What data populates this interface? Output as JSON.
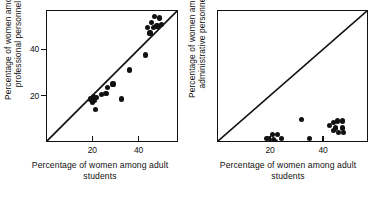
{
  "figure": {
    "panel_count": 2,
    "background_color": "#ffffff",
    "ink_color": "#111111"
  },
  "chart_data": [
    {
      "type": "scatter",
      "panel": "left",
      "title": "",
      "xlabel": "Percentage of women among adult\nstudents",
      "ylabel": "Percentage of women among\nprofessional personnel",
      "xlim": [
        0,
        57
      ],
      "ylim": [
        0,
        57
      ],
      "xticks": [
        20,
        40
      ],
      "xticklabels": [
        "20",
        "40"
      ],
      "yticks": [
        20,
        40
      ],
      "yticklabels": [
        "20",
        "40"
      ],
      "grid": false,
      "legend": "none",
      "reference_line": {
        "label": "identity-line",
        "type": "line",
        "from": [
          0,
          0
        ],
        "to": [
          57,
          57
        ]
      },
      "points": [
        {
          "x": 19.0,
          "y": 19.0
        },
        {
          "x": 19.5,
          "y": 17.5
        },
        {
          "x": 20.0,
          "y": 20.0
        },
        {
          "x": 20.5,
          "y": 18.5
        },
        {
          "x": 21.0,
          "y": 14.5
        },
        {
          "x": 21.5,
          "y": 19.5
        },
        {
          "x": 23.5,
          "y": 21.0
        },
        {
          "x": 25.5,
          "y": 21.5
        },
        {
          "x": 26.0,
          "y": 24.0
        },
        {
          "x": 28.5,
          "y": 25.5
        },
        {
          "x": 32.0,
          "y": 19.0
        },
        {
          "x": 35.5,
          "y": 31.5
        },
        {
          "x": 42.5,
          "y": 38.0
        },
        {
          "x": 43.5,
          "y": 50.0
        },
        {
          "x": 44.5,
          "y": 47.5
        },
        {
          "x": 45.0,
          "y": 52.0
        },
        {
          "x": 46.0,
          "y": 50.0
        },
        {
          "x": 46.5,
          "y": 54.5
        },
        {
          "x": 47.5,
          "y": 50.5
        },
        {
          "x": 48.5,
          "y": 54.0
        },
        {
          "x": 49.5,
          "y": 51.0
        }
      ]
    },
    {
      "type": "scatter",
      "panel": "right",
      "title": "",
      "xlabel": "Percentage of women among adult\nstudents",
      "ylabel": "Percentage of women among\nadministrative personnel",
      "xlim": [
        0,
        57
      ],
      "ylim": [
        0,
        57
      ],
      "xticks": [
        20,
        40
      ],
      "xticklabels": [
        "20",
        "40"
      ],
      "yticks": [],
      "yticklabels": [],
      "grid": false,
      "legend": "none",
      "reference_line": {
        "label": "identity-line",
        "type": "line",
        "from": [
          0,
          0
        ],
        "to": [
          57,
          57
        ]
      },
      "points": [
        {
          "x": 18.5,
          "y": 2.0
        },
        {
          "x": 20.5,
          "y": 3.5
        },
        {
          "x": 21.0,
          "y": 1.5
        },
        {
          "x": 21.5,
          "y": 0.8
        },
        {
          "x": 22.5,
          "y": 3.5
        },
        {
          "x": 24.0,
          "y": 2.0
        },
        {
          "x": 31.5,
          "y": 10.0
        },
        {
          "x": 34.5,
          "y": 2.0
        },
        {
          "x": 42.0,
          "y": 7.5
        },
        {
          "x": 43.5,
          "y": 9.0
        },
        {
          "x": 43.5,
          "y": 5.5
        },
        {
          "x": 44.5,
          "y": 6.5
        },
        {
          "x": 45.0,
          "y": 9.5
        },
        {
          "x": 45.5,
          "y": 4.5
        },
        {
          "x": 47.0,
          "y": 9.5
        },
        {
          "x": 47.0,
          "y": 6.5
        },
        {
          "x": 47.5,
          "y": 4.5
        }
      ]
    }
  ]
}
